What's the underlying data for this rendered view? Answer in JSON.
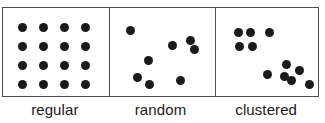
{
  "figure": {
    "width": 325,
    "height": 123,
    "background_color": "#ffffff",
    "border_color": "#4d4d4d",
    "dot_color": "#1a1a1a",
    "dot_diameter": 9
  },
  "panels": [
    {
      "id": "regular",
      "label": "regular",
      "left": 0,
      "width": 106,
      "point_count": 16,
      "points": [
        {
          "x": 21,
          "y": 26
        },
        {
          "x": 42,
          "y": 26
        },
        {
          "x": 63,
          "y": 26
        },
        {
          "x": 84,
          "y": 26
        },
        {
          "x": 21,
          "y": 45
        },
        {
          "x": 42,
          "y": 45
        },
        {
          "x": 63,
          "y": 45
        },
        {
          "x": 84,
          "y": 45
        },
        {
          "x": 21,
          "y": 64
        },
        {
          "x": 42,
          "y": 64
        },
        {
          "x": 63,
          "y": 64
        },
        {
          "x": 84,
          "y": 64
        },
        {
          "x": 21,
          "y": 83
        },
        {
          "x": 42,
          "y": 83
        },
        {
          "x": 63,
          "y": 83
        },
        {
          "x": 84,
          "y": 83
        }
      ]
    },
    {
      "id": "random",
      "label": "random",
      "left": 106,
      "width": 106,
      "point_count": 8,
      "points": [
        {
          "x": 128,
          "y": 29
        },
        {
          "x": 170,
          "y": 44
        },
        {
          "x": 188,
          "y": 39
        },
        {
          "x": 192,
          "y": 48
        },
        {
          "x": 146,
          "y": 59
        },
        {
          "x": 135,
          "y": 76
        },
        {
          "x": 147,
          "y": 83
        },
        {
          "x": 178,
          "y": 79
        }
      ]
    },
    {
      "id": "clustered",
      "label": "clustered",
      "left": 212,
      "width": 105,
      "point_count": 11,
      "points": [
        {
          "x": 236,
          "y": 31
        },
        {
          "x": 248,
          "y": 31
        },
        {
          "x": 267,
          "y": 31
        },
        {
          "x": 237,
          "y": 45
        },
        {
          "x": 250,
          "y": 45
        },
        {
          "x": 265,
          "y": 73
        },
        {
          "x": 284,
          "y": 63
        },
        {
          "x": 282,
          "y": 75
        },
        {
          "x": 289,
          "y": 79
        },
        {
          "x": 297,
          "y": 69
        },
        {
          "x": 307,
          "y": 83
        }
      ]
    }
  ],
  "chart_data": {
    "type": "scatter",
    "title": "",
    "xlabel": "",
    "ylabel": "",
    "grid": false,
    "legend": "none",
    "series": [
      {
        "name": "regular",
        "values": [
          [
            21,
            26
          ],
          [
            42,
            26
          ],
          [
            63,
            26
          ],
          [
            84,
            26
          ],
          [
            21,
            45
          ],
          [
            42,
            45
          ],
          [
            63,
            45
          ],
          [
            84,
            45
          ],
          [
            21,
            64
          ],
          [
            42,
            64
          ],
          [
            63,
            64
          ],
          [
            84,
            64
          ],
          [
            21,
            83
          ],
          [
            42,
            83
          ],
          [
            63,
            83
          ],
          [
            84,
            83
          ]
        ]
      },
      {
        "name": "random",
        "values": [
          [
            128,
            29
          ],
          [
            170,
            44
          ],
          [
            188,
            39
          ],
          [
            192,
            48
          ],
          [
            146,
            59
          ],
          [
            135,
            76
          ],
          [
            147,
            83
          ],
          [
            178,
            79
          ]
        ]
      },
      {
        "name": "clustered",
        "values": [
          [
            236,
            31
          ],
          [
            248,
            31
          ],
          [
            267,
            31
          ],
          [
            237,
            45
          ],
          [
            250,
            45
          ],
          [
            265,
            73
          ],
          [
            284,
            63
          ],
          [
            282,
            75
          ],
          [
            289,
            79
          ],
          [
            297,
            69
          ],
          [
            307,
            83
          ]
        ]
      }
    ]
  }
}
